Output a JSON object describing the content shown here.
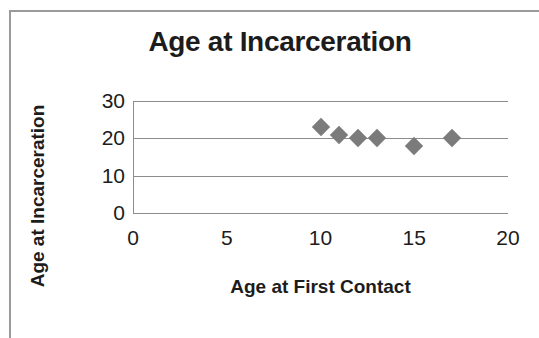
{
  "chart_data": {
    "type": "scatter",
    "title": "Age at Incarceration",
    "xlabel": "Age at First Contact",
    "ylabel": "Age at Incarceration",
    "x": [
      10,
      11,
      12,
      13,
      15,
      17
    ],
    "values": [
      23,
      21,
      20,
      20,
      18,
      20
    ],
    "points": [
      {
        "x": 10,
        "y": 23
      },
      {
        "x": 11,
        "y": 21
      },
      {
        "x": 12,
        "y": 20
      },
      {
        "x": 13,
        "y": 20
      },
      {
        "x": 15,
        "y": 18
      },
      {
        "x": 17,
        "y": 20
      }
    ],
    "xlim": [
      0,
      20
    ],
    "ylim": [
      0,
      30
    ],
    "xticks": [
      "0",
      "5",
      "10",
      "15",
      "20"
    ],
    "yticks": [
      "0",
      "10",
      "20",
      "30"
    ],
    "xtick_values": [
      0,
      5,
      10,
      15,
      20
    ],
    "ytick_values": [
      0,
      10,
      20,
      30
    ],
    "grid": true,
    "grid_axis": "y",
    "legend": false,
    "marker": "diamond",
    "marker_color": "#7b7b7b",
    "grid_color": "#8d8d8d",
    "background": "#ffffff"
  }
}
